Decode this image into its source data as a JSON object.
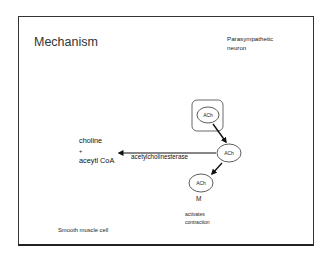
{
  "slide": {
    "title": "Mechanism",
    "neuron_label_line1": "Parasympathetic",
    "neuron_label_line2": "neuron",
    "products": {
      "line1": "choline",
      "line2": "+",
      "line3": "aceytl CoA"
    },
    "enzyme_label": "acetylcholinesterase",
    "nodes": {
      "vesicle_ach": "ACh",
      "synaptic_ach": "ACh",
      "receptor_ach": "ACh"
    },
    "receptor_label": "M",
    "effect_line1": "activates",
    "effect_line2": "contraction",
    "cell_label": "Smooth muscle cell"
  },
  "colors": {
    "background": "#ffffff",
    "border": "#333333",
    "text": "#222222",
    "arrow": "#111111"
  }
}
